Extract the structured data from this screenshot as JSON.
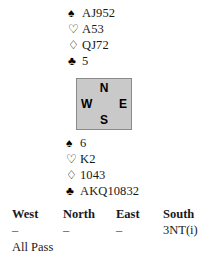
{
  "hands": {
    "north": {
      "position_label": "North",
      "suits": [
        {
          "suit": "spades",
          "symbol": "♠",
          "style": "filled",
          "cards": "AJ952"
        },
        {
          "suit": "hearts",
          "symbol": "♡",
          "style": "hollow",
          "cards": "A53"
        },
        {
          "suit": "diamonds",
          "symbol": "♢",
          "style": "hollow",
          "cards": "QJ72"
        },
        {
          "suit": "clubs",
          "symbol": "♣",
          "style": "filled",
          "cards": "5"
        }
      ]
    },
    "south": {
      "position_label": "South",
      "suits": [
        {
          "suit": "spades",
          "symbol": "♠",
          "style": "filled",
          "cards": "6"
        },
        {
          "suit": "hearts",
          "symbol": "♡",
          "style": "hollow",
          "cards": "K2"
        },
        {
          "suit": "diamonds",
          "symbol": "♢",
          "style": "hollow",
          "cards": "1043"
        },
        {
          "suit": "clubs",
          "symbol": "♣",
          "style": "filled",
          "cards": "AKQ10832"
        }
      ]
    }
  },
  "compass": {
    "north": "N",
    "west": "W",
    "east": "E",
    "south": "S",
    "fill_color": "#c9c9c9",
    "border_color": "#8a8a8a"
  },
  "bidding": {
    "headers": {
      "west": "West",
      "north": "North",
      "east": "East",
      "south": "South"
    },
    "rows": [
      {
        "west": "–",
        "north": "–",
        "east": "–",
        "south": "3NT(i)"
      }
    ],
    "final": "All Pass"
  }
}
